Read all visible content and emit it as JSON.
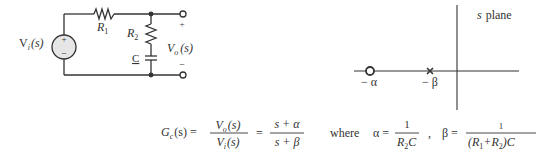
{
  "circuit": {
    "source_label": "V",
    "source_sub": "i",
    "source_arg": "(s)",
    "source_plus": "+",
    "source_minus": "−",
    "r1_label": "R",
    "r1_sub": "1",
    "r2_label": "R",
    "r2_sub": "2",
    "c_label": "C",
    "out_label": "V",
    "out_sub": "o",
    "out_arg": "(s)",
    "out_plus": "+",
    "out_minus": "−"
  },
  "splane": {
    "title_s": "s",
    "title_rest": "plane",
    "zero_label": "− α",
    "pole_label": "− β"
  },
  "formula": {
    "lhs": "G",
    "lhs_sub": "c",
    "lhs_arg": "(s) =",
    "frac1_num": "V",
    "frac1_num_sub": "o",
    "frac1_num_arg": "(s)",
    "frac1_den": "V",
    "frac1_den_sub": "i",
    "frac1_den_arg": "(s)",
    "eq2": "=",
    "frac2_num": "s + α",
    "frac2_den": "s + β",
    "where": "where",
    "alpha_eq": "α =",
    "alpha_num": "1",
    "alpha_den_R": "R",
    "alpha_den_sub": "2",
    "alpha_den_C": "C",
    "comma": ",",
    "beta_eq": "β =",
    "beta_num": "1",
    "beta_den_a": "(R",
    "beta_den_sub1": "1",
    "beta_den_b": "+R",
    "beta_den_sub2": "2",
    "beta_den_c": ")C"
  }
}
